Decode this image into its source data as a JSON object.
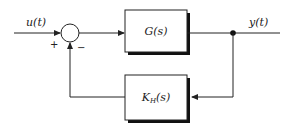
{
  "diagram": {
    "type": "feedback-control-block-diagram",
    "input_signal": "u(t)",
    "output_signal": "y(t)",
    "summing_junction": {
      "plus_sign": "+",
      "minus_sign": "−"
    },
    "forward_block": {
      "label": "G(s)"
    },
    "feedback_block": {
      "label_main": "K",
      "label_sub": "H",
      "label_tail": "(s)"
    },
    "colors": {
      "line": "#222222",
      "shadow": "#111111",
      "background": "#ffffff"
    }
  }
}
